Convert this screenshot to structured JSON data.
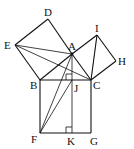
{
  "figure": {
    "points": {
      "A": "A",
      "B": "B",
      "C": "C",
      "D": "D",
      "E": "E",
      "F": "F",
      "G": "G",
      "H": "H",
      "I": "I",
      "J": "J",
      "K": "K"
    },
    "segments": [
      [
        "E",
        "D"
      ],
      [
        "D",
        "A"
      ],
      [
        "A",
        "C"
      ],
      [
        "E",
        "B"
      ],
      [
        "A",
        "B"
      ],
      [
        "A",
        "I"
      ],
      [
        "I",
        "H"
      ],
      [
        "H",
        "C"
      ],
      [
        "I",
        "C"
      ],
      [
        "B",
        "C"
      ],
      [
        "B",
        "F"
      ],
      [
        "F",
        "G"
      ],
      [
        "G",
        "C"
      ],
      [
        "A",
        "K"
      ],
      [
        "E",
        "A"
      ],
      [
        "E",
        "C"
      ],
      [
        "F",
        "A"
      ],
      [
        "F",
        "J"
      ]
    ],
    "right_angle_marks": [
      "J",
      "K"
    ],
    "colors": {
      "stroke": "#111111",
      "background": "#ffffff"
    }
  }
}
